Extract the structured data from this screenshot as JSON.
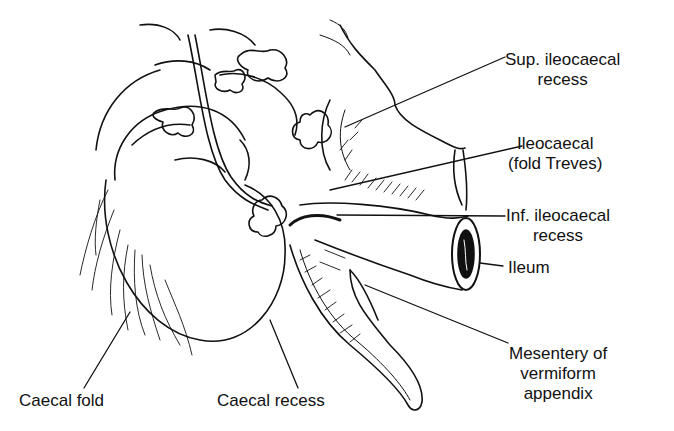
{
  "figure": {
    "colors": {
      "ink": "#111111",
      "background": "#ffffff"
    }
  },
  "labels": {
    "sup_ileocaecal_recess": [
      "Sup. ileocaecal",
      "recess"
    ],
    "ileocaecal_fold": [
      "Ileocaecal",
      "(fold Treves)"
    ],
    "inf_ileocaecal_recess": [
      "Inf. ileocaecal",
      "recess"
    ],
    "ileum": [
      "Ileum"
    ],
    "mesentery": [
      "Mesentery of",
      "vermiform",
      "appendix"
    ],
    "caecal_fold": [
      "Caecal fold"
    ],
    "caecal_recess": [
      "Caecal recess"
    ]
  }
}
